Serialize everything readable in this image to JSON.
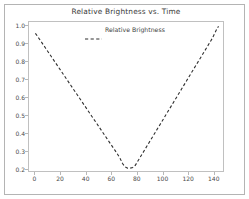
{
  "figure": {
    "width": 249,
    "height": 199,
    "background": "#ffffff",
    "frame_color": "#b4b4b4"
  },
  "chart_data": {
    "type": "line",
    "title": "Relative Brightness vs. Time",
    "xlabel": "",
    "ylabel": "",
    "xlim": [
      -5,
      148
    ],
    "ylim": [
      0.185,
      1.025
    ],
    "grid": false,
    "legend_position": "upper center",
    "line_style": "dashed",
    "line_color": "#2f2f2f",
    "xticks": [
      0,
      20,
      40,
      60,
      80,
      100,
      120,
      140
    ],
    "xtick_labels": [
      "0",
      "20",
      "40",
      "60",
      "80",
      "100",
      "120",
      "140"
    ],
    "yticks": [
      0.2,
      0.3,
      0.4,
      0.5,
      0.6,
      0.7,
      0.8,
      0.9,
      1.0
    ],
    "ytick_labels": [
      "0.2",
      "0.3",
      "0.4",
      "0.5",
      "0.6",
      "0.7",
      "0.8",
      "0.9",
      "1.0"
    ],
    "series": [
      {
        "name": "Relative Brightness",
        "x": [
          0,
          4,
          8,
          12,
          16,
          20,
          24,
          28,
          32,
          36,
          40,
          44,
          48,
          52,
          56,
          60,
          62,
          64,
          66,
          68,
          70,
          72,
          74,
          76,
          78,
          80,
          82,
          86,
          90,
          94,
          98,
          102,
          106,
          110,
          114,
          118,
          122,
          126,
          130,
          134,
          138,
          142,
          143
        ],
        "y": [
          0.962,
          0.921,
          0.879,
          0.837,
          0.795,
          0.753,
          0.711,
          0.669,
          0.627,
          0.585,
          0.543,
          0.501,
          0.459,
          0.417,
          0.375,
          0.333,
          0.312,
          0.291,
          0.268,
          0.238,
          0.219,
          0.212,
          0.212,
          0.216,
          0.228,
          0.252,
          0.275,
          0.322,
          0.369,
          0.416,
          0.463,
          0.51,
          0.557,
          0.604,
          0.651,
          0.698,
          0.745,
          0.792,
          0.839,
          0.886,
          0.933,
          0.992,
          1.0
        ],
        "minimum_x": 73,
        "minimum_y": 0.212,
        "start_y": 0.962,
        "end_y": 1.0
      }
    ]
  },
  "legend": {
    "entries": [
      {
        "label": "Relative Brightness",
        "marker": "dashed-line",
        "color": "#2f2f2f"
      }
    ]
  }
}
